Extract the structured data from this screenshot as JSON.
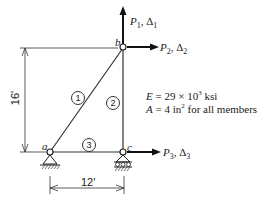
{
  "diagram": {
    "nodes": [
      {
        "id": "a",
        "label": "a"
      },
      {
        "id": "b",
        "label": "b"
      },
      {
        "id": "c",
        "label": "c"
      }
    ],
    "members": [
      {
        "id": "1",
        "label": "1",
        "from": "a",
        "to": "b"
      },
      {
        "id": "2",
        "label": "2",
        "from": "c",
        "to": "b"
      },
      {
        "id": "3",
        "label": "3",
        "from": "a",
        "to": "c"
      }
    ],
    "loads": [
      {
        "label": "P",
        "sub": "1",
        "delta": "Δ",
        "delta_sub": "1",
        "direction": "up",
        "node": "b"
      },
      {
        "label": "P",
        "sub": "2",
        "delta": "Δ",
        "delta_sub": "2",
        "direction": "right",
        "node": "b"
      },
      {
        "label": "P",
        "sub": "3",
        "delta": "Δ",
        "delta_sub": "3",
        "direction": "right",
        "node": "c"
      }
    ],
    "dimensions": {
      "height": "16'",
      "width": "12'"
    },
    "properties": {
      "E_label": "E",
      "E_value": "= 29 × 10",
      "E_exp": "3",
      "E_unit": " ksi",
      "A_label": "A",
      "A_value": "= 4 in",
      "A_exp": "2",
      "A_unit": " for all members"
    }
  }
}
